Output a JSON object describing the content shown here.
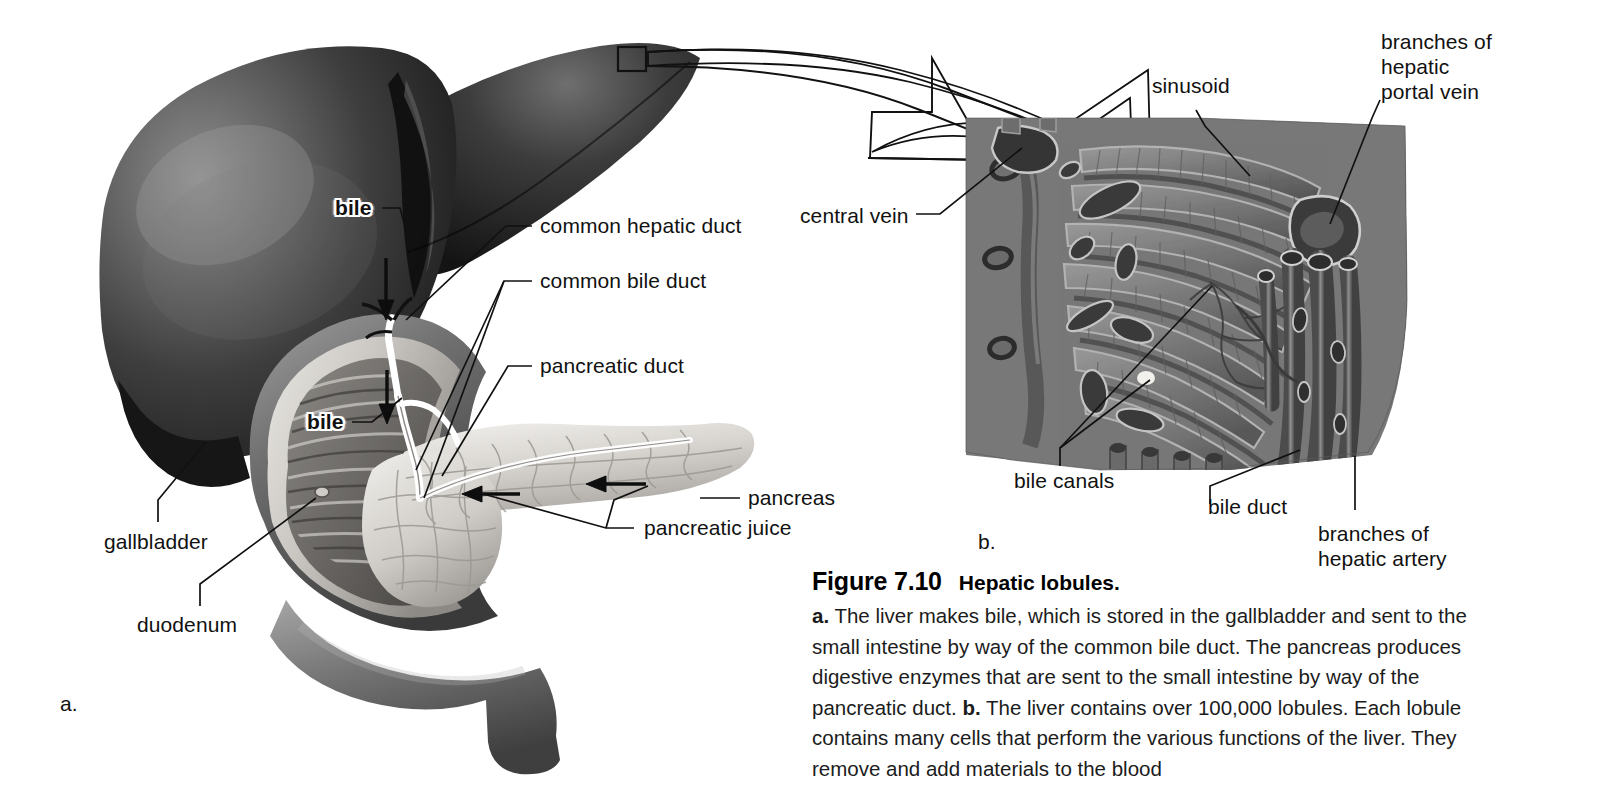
{
  "figure": {
    "panel_a_mark": "a.",
    "panel_b_mark": "b.",
    "caption_number": "Figure 7.10",
    "caption_title": "Hepatic lobules.",
    "caption_a_marker": "a.",
    "caption_a_text": " The liver makes bile, which is stored in the gallbladder and sent to the small intestine by way of the common bile duct. The pancreas produces digestive enzymes that are sent to the small intestine by way of the pancreatic duct. ",
    "caption_b_marker": "b.",
    "caption_b_text": " The liver contains over 100,000 lobules. Each lobule contains many cells that perform the various functions of the liver. They remove and add materials to the blood"
  },
  "panel_a_labels": {
    "bile_upper": "bile",
    "bile_lower": "bile",
    "common_hepatic_duct": "common hepatic duct",
    "common_bile_duct": "common bile duct",
    "pancreatic_duct": "pancreatic duct",
    "pancreas": "pancreas",
    "pancreatic_juice": "pancreatic juice",
    "gallbladder": "gallbladder",
    "duodenum": "duodenum"
  },
  "panel_b_labels": {
    "sinusoid": "sinusoid",
    "branches_of_hepatic_portal_vein_l1": "branches of",
    "branches_of_hepatic_portal_vein_l2": "hepatic",
    "branches_of_hepatic_portal_vein_l3": "portal vein",
    "central_vein": "central vein",
    "bile_canals": "bile canals",
    "bile_duct": "bile duct",
    "branches_of_hepatic_artery_l1": "branches of",
    "branches_of_hepatic_artery_l2": "hepatic artery"
  },
  "colors": {
    "ink": "#111111",
    "paper": "#ffffff",
    "liver_dark": "#2a2a2a",
    "liver_mid": "#5a5a5a",
    "duodenum": "#6e6e6e",
    "pancreas_light": "#d6d3ce",
    "lobule_mid": "#8a8a8a",
    "lobule_dark": "#4e4e4e"
  }
}
